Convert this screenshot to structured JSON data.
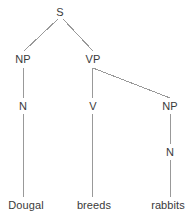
{
  "diagram": {
    "type": "constituency-syntax-tree",
    "sentence": "Dougal breeds rabbits",
    "background_color": "#ffffff",
    "line_color": "#999999",
    "text_color": "#3a3a3a",
    "nodes": [
      {
        "id": "S",
        "label": "S",
        "x": 60,
        "y": 12,
        "level": 0,
        "kind": "nonterminal"
      },
      {
        "id": "NP1",
        "label": "NP",
        "x": 23,
        "y": 59,
        "level": 1,
        "kind": "nonterminal"
      },
      {
        "id": "VP",
        "label": "VP",
        "x": 93,
        "y": 59,
        "level": 1,
        "kind": "nonterminal"
      },
      {
        "id": "N1",
        "label": "N",
        "x": 23,
        "y": 106,
        "level": 2,
        "kind": "nonterminal"
      },
      {
        "id": "V",
        "label": "V",
        "x": 93,
        "y": 106,
        "level": 2,
        "kind": "nonterminal"
      },
      {
        "id": "NP2",
        "label": "NP",
        "x": 170,
        "y": 106,
        "level": 2,
        "kind": "nonterminal"
      },
      {
        "id": "N2",
        "label": "N",
        "x": 170,
        "y": 152,
        "level": 3,
        "kind": "nonterminal"
      },
      {
        "id": "W1",
        "label": "Dougal",
        "x": 26,
        "y": 205,
        "level": 4,
        "kind": "terminal"
      },
      {
        "id": "W2",
        "label": "breeds",
        "x": 94,
        "y": 205,
        "level": 4,
        "kind": "terminal"
      },
      {
        "id": "W3",
        "label": "rabbits",
        "x": 168,
        "y": 205,
        "level": 4,
        "kind": "terminal"
      }
    ],
    "edges": [
      {
        "from": "S",
        "to": "NP1",
        "x1": 58,
        "y1": 19,
        "x2": 24,
        "y2": 51
      },
      {
        "from": "S",
        "to": "VP",
        "x1": 63,
        "y1": 19,
        "x2": 93,
        "y2": 51
      },
      {
        "from": "NP1",
        "to": "N1",
        "x1": 23,
        "y1": 68,
        "x2": 23,
        "y2": 98
      },
      {
        "from": "VP",
        "to": "V",
        "x1": 92,
        "y1": 68,
        "x2": 92,
        "y2": 98
      },
      {
        "from": "VP",
        "to": "NP2",
        "x1": 93,
        "y1": 68,
        "x2": 170,
        "y2": 98
      },
      {
        "from": "N1",
        "to": "W1",
        "x1": 23,
        "y1": 114,
        "x2": 23,
        "y2": 197
      },
      {
        "from": "V",
        "to": "W2",
        "x1": 92,
        "y1": 114,
        "x2": 92,
        "y2": 197
      },
      {
        "from": "NP2",
        "to": "N2",
        "x1": 170,
        "y1": 114,
        "x2": 170,
        "y2": 144
      },
      {
        "from": "N2",
        "to": "W3",
        "x1": 170,
        "y1": 160,
        "x2": 170,
        "y2": 197
      }
    ]
  }
}
